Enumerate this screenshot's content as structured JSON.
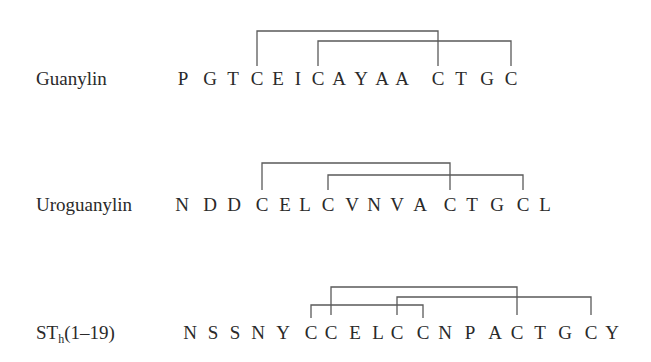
{
  "figure": {
    "type": "disulfide-bond-diagram",
    "line_color": "#5a5a5a",
    "text_color": "#2a2a2a"
  },
  "peptides": [
    {
      "name": "Guanylin",
      "label_main": "Guanylin",
      "label_sub": "",
      "label_suffix": "",
      "sequence": [
        "P",
        "G",
        "T",
        "C",
        "E",
        "I",
        "C",
        "A",
        "Y",
        "A",
        "A",
        "C",
        "T",
        "G",
        "C"
      ],
      "residue_x": [
        183,
        210,
        233,
        257,
        278,
        298,
        318,
        339,
        361,
        382,
        402,
        438,
        461,
        487,
        511
      ],
      "baseline_y": 85,
      "label_x": 36,
      "bonds": [
        {
          "from_index": 3,
          "to_index": 11,
          "bracket_y": 31,
          "drop_to_y": 66
        },
        {
          "from_index": 6,
          "to_index": 14,
          "bracket_y": 41,
          "drop_to_y": 66
        }
      ]
    },
    {
      "name": "Uroguanylin",
      "label_main": "Uroguanylin",
      "label_sub": "",
      "label_suffix": "",
      "sequence": [
        "N",
        "D",
        "D",
        "C",
        "E",
        "L",
        "C",
        "V",
        "N",
        "V",
        "A",
        "C",
        "T",
        "G",
        "C",
        "L"
      ],
      "residue_x": [
        182,
        210,
        234,
        262,
        285,
        305,
        328,
        352,
        374,
        397,
        420,
        450,
        472,
        497,
        523,
        545
      ],
      "baseline_y": 211,
      "label_x": 36,
      "bonds": [
        {
          "from_index": 3,
          "to_index": 11,
          "bracket_y": 163,
          "drop_to_y": 190
        },
        {
          "from_index": 6,
          "to_index": 14,
          "bracket_y": 175,
          "drop_to_y": 190
        }
      ]
    },
    {
      "name": "STh(1-19)",
      "label_main": "ST",
      "label_sub": "h",
      "label_suffix": "(1–19)",
      "sequence": [
        "N",
        "S",
        "S",
        "N",
        "Y",
        "C",
        "C",
        "E",
        "L",
        "C",
        "C",
        "N",
        "P",
        "A",
        "C",
        "T",
        "G",
        "C",
        "Y"
      ],
      "residue_x": [
        190,
        213,
        235,
        258,
        283,
        311,
        331,
        355,
        378,
        397,
        423,
        445,
        470,
        495,
        517,
        540,
        565,
        591,
        612
      ],
      "baseline_y": 339,
      "label_x": 36,
      "bonds": [
        {
          "from_index": 6,
          "to_index": 14,
          "bracket_y": 287,
          "drop_to_y": 315
        },
        {
          "from_index": 9,
          "to_index": 17,
          "bracket_y": 297,
          "drop_to_y": 315
        },
        {
          "from_index": 5,
          "to_index": 10,
          "bracket_y": 305,
          "drop_to_y": 318
        }
      ]
    }
  ]
}
